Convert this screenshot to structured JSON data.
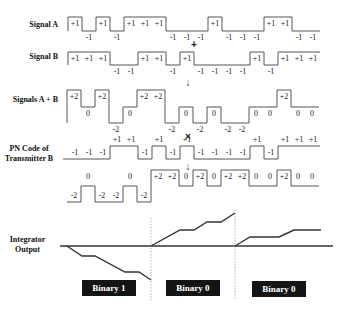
{
  "rows": {
    "signal_a": {
      "label": "Signal A",
      "chips": [
        1,
        -1,
        1,
        -1,
        1,
        1,
        1,
        -1,
        -1,
        -1,
        1,
        -1,
        -1,
        -1,
        1,
        1,
        -1,
        -1
      ],
      "chip_labels": [
        "+1",
        "-1",
        "+1",
        "-1",
        "+1",
        "+1",
        "+1",
        "-1",
        "-1",
        "-1",
        "+1",
        "-1",
        "-1",
        "-1",
        "+1",
        "+1",
        "-1",
        "-1"
      ]
    },
    "signal_b": {
      "label": "Signal B",
      "chips": [
        1,
        1,
        1,
        -1,
        -1,
        1,
        1,
        -1,
        1,
        -1,
        -1,
        -1,
        -1,
        1,
        -1,
        1,
        1,
        1
      ],
      "chip_labels": [
        "+1",
        "+1",
        "+1",
        "-1",
        "-1",
        "+1",
        "+1",
        "-1",
        "+1",
        "-1",
        "-1",
        "-1",
        "-1",
        "+1",
        "-1",
        "+1",
        "+1",
        "+1"
      ]
    },
    "sum": {
      "label": "Signals A + B",
      "chips": [
        2,
        0,
        2,
        -2,
        0,
        2,
        2,
        -2,
        0,
        -2,
        0,
        -2,
        -2,
        0,
        0,
        2,
        0,
        0
      ],
      "chip_labels": [
        "+2",
        "0",
        "+2",
        "-2",
        "0",
        "+2",
        "+2",
        "-2",
        "0",
        "-2",
        "0",
        "-2",
        "-2",
        "0",
        "0",
        "+2",
        "0",
        "0"
      ]
    },
    "pn_code_b": {
      "label_line1": "PN Code of",
      "label_line2": "Transmitter B",
      "chips": [
        -1,
        -1,
        -1,
        1,
        1,
        -1,
        1,
        -1,
        1,
        -1,
        -1,
        -1,
        -1,
        1,
        -1,
        1,
        1,
        1
      ],
      "chip_labels": [
        "-1",
        "-1",
        "-1",
        "+1",
        "+1",
        "-1",
        "+1",
        "-1",
        "+1",
        "-1",
        "-1",
        "-1",
        "-1",
        "+1",
        "-1",
        "+1",
        "+1",
        "+1"
      ]
    },
    "product": {
      "chips": [
        -2,
        0,
        -2,
        -2,
        0,
        -2,
        2,
        2,
        0,
        2,
        0,
        2,
        2,
        0,
        0,
        2,
        0,
        0
      ],
      "chip_labels": [
        "-2",
        "0",
        "-2",
        "-2",
        "0",
        "-2",
        "+2",
        "+2",
        "0",
        "+2",
        "0",
        "+2",
        "+2",
        "0",
        "0",
        "+2",
        "0",
        "0"
      ]
    }
  },
  "operators": {
    "plus": "+",
    "arrow_down": "↓",
    "times": "×"
  },
  "integrator": {
    "label_line1": "Integrator",
    "label_line2": "Output",
    "segments": [
      [
        [
          67,
          246
        ],
        [
          82,
          256
        ],
        [
          95,
          256
        ],
        [
          125,
          272
        ],
        [
          139,
          272
        ],
        [
          151,
          280
        ]
      ],
      [
        [
          151,
          246
        ],
        [
          180,
          230
        ],
        [
          194,
          230
        ],
        [
          207,
          222
        ],
        [
          221,
          222
        ],
        [
          235,
          213
        ]
      ],
      [
        [
          235,
          246
        ],
        [
          250,
          237
        ],
        [
          279,
          237
        ],
        [
          294,
          230
        ],
        [
          321,
          230
        ]
      ]
    ],
    "decisions": [
      "Binary 1",
      "Binary 0",
      "Binary 0"
    ]
  },
  "colors": {
    "waveform": "#555555",
    "integrator_line": "#333333",
    "label_box": "#141414",
    "label_text": "#ffffff"
  }
}
